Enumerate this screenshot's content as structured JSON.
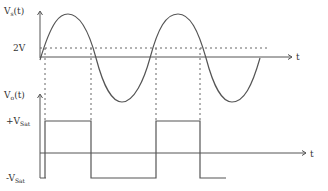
{
  "diagram": {
    "input_plot": {
      "y_label": "V",
      "y_label_sub": "s",
      "y_label_suffix": "(t)",
      "x_label": "t",
      "reference_label": "2V"
    },
    "output_plot": {
      "y_label": "V",
      "y_label_sub": "o",
      "y_label_suffix": "(t)",
      "x_label": "t",
      "high_label_prefix": "+V",
      "high_label_sub": "Sat",
      "low_label_prefix": "-V",
      "low_label_sub": "Sat"
    },
    "colors": {
      "line": "#555555",
      "text": "#333333"
    }
  }
}
